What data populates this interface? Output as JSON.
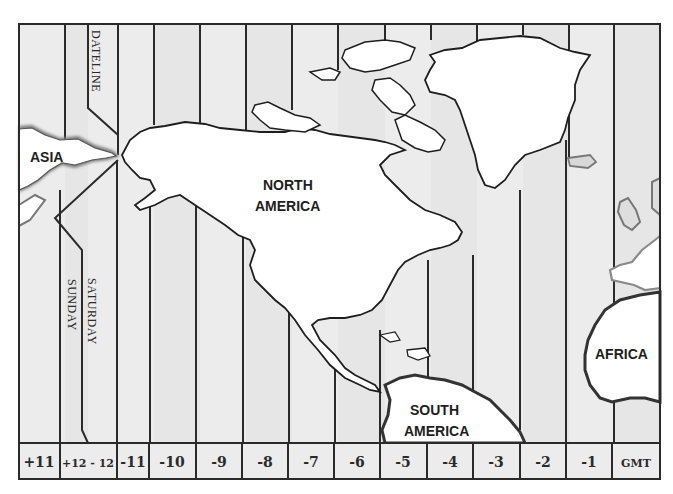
{
  "map": {
    "title": "World Time Zones - Western Hemisphere",
    "colors": {
      "ocean_light": "#ededed",
      "ocean_dark": "#e2e2e2",
      "land": "#ffffff",
      "outline": "#1e1e1e",
      "halo": "#9a9a9a"
    },
    "labels": {
      "dateline": "DATELINE",
      "saturday": "SATURDAY",
      "sunday": "SUNDAY"
    },
    "continents": [
      {
        "id": "asia",
        "label": "ASIA"
      },
      {
        "id": "north-america",
        "label_line1": "NORTH",
        "label_line2": "AMERICA"
      },
      {
        "id": "south-america",
        "label_line1": "SOUTH",
        "label_line2": "AMERICA"
      },
      {
        "id": "africa",
        "label": "AFRICA"
      }
    ],
    "time_zones": [
      "+11",
      "+12 - 12",
      "-11",
      "-10",
      "-9",
      "-8",
      "-7",
      "-6",
      "-5",
      "-4",
      "-3",
      "-2",
      "-1",
      "GMT"
    ]
  }
}
